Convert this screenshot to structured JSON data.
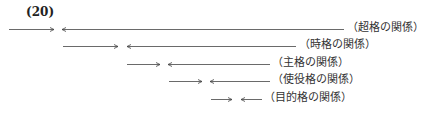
{
  "figure_number": "(20)",
  "rows": [
    {
      "label": "（超格の関係）",
      "y": 29,
      "right_arrow": [
        9,
        54
      ],
      "left_arrow": [
        62,
        344
      ],
      "label_x": 347
    },
    {
      "label": "（時格の関係）",
      "y": 46,
      "right_arrow": [
        63,
        118
      ],
      "left_arrow": [
        127,
        296
      ],
      "label_x": 299
    },
    {
      "label": "（主格の関係）",
      "y": 64,
      "right_arrow": [
        127,
        160
      ],
      "left_arrow": [
        168,
        270
      ],
      "label_x": 272
    },
    {
      "label": "（使役格の関係）",
      "y": 81,
      "right_arrow": [
        169,
        202
      ],
      "left_arrow": [
        210,
        270
      ],
      "label_x": 272
    },
    {
      "label": "（目的格の関係）",
      "y": 99,
      "right_arrow": [
        211,
        232
      ],
      "left_arrow": [
        241,
        262
      ],
      "label_x": 264
    }
  ],
  "colors": {
    "line": "#444444"
  }
}
